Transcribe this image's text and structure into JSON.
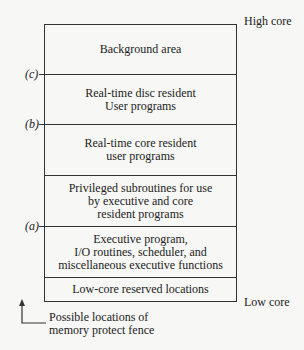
{
  "diagram": {
    "top_label": "High core",
    "bottom_label": "Low core",
    "regions": [
      {
        "text": "Background area"
      },
      {
        "text": "Real-time disc resident\nUser programs"
      },
      {
        "text": "Real-time core resident\nuser programs"
      },
      {
        "text": "Privileged subroutines for use\nby executive and core\nresident programs"
      },
      {
        "text": "Executive program,\nI/O routines, scheduler, and\nmiscellaneous executive functions"
      },
      {
        "text": "Low-core reserved locations"
      }
    ],
    "fence_markers": [
      {
        "label": "(c)"
      },
      {
        "label": "(b)"
      },
      {
        "label": "(a)"
      }
    ],
    "note": "Possible locations of\nmemory protect fence"
  }
}
